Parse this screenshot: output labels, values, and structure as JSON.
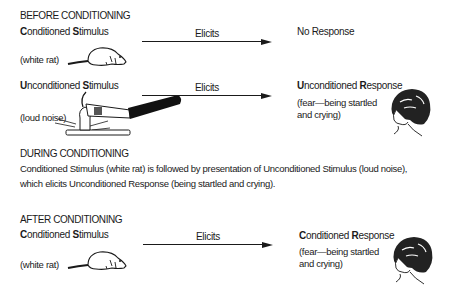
{
  "before": {
    "heading": "BEFORE CONDITIONING",
    "row1": {
      "stimulus_first": "C",
      "stimulus_a": "onditioned ",
      "stimulus_s": "S",
      "stimulus_b": "timulus",
      "stimulus_example": "(white rat)",
      "arrow_label": "Elicits",
      "response": "No Response",
      "icon": "rat-icon"
    },
    "row2": {
      "stimulus_first": "U",
      "stimulus_a": "nconditioned ",
      "stimulus_s": "S",
      "stimulus_b": "timulus",
      "stimulus_example": "(loud noise)",
      "arrow_label": "Elicits",
      "response_first": "U",
      "response_a": "nconditioned ",
      "response_r": "R",
      "response_b": "esponse",
      "response_line1": "(fear—being startled",
      "response_line2": "and crying)",
      "icon": "hammer-icon",
      "response_icon": "child-face-icon"
    }
  },
  "during": {
    "heading": "DURING CONDITIONING",
    "line1": "Conditioned Stimulus (white rat) is followed by presentation of Unconditioned Stimulus (loud noise),",
    "line2": "which elicits  Unconditioned Response (being startled and crying)."
  },
  "after": {
    "heading": "AFTER CONDITIONING",
    "row": {
      "stimulus_first": "C",
      "stimulus_a": "onditioned ",
      "stimulus_s": "S",
      "stimulus_b": "timulus",
      "stimulus_example": "(white rat)",
      "arrow_label": "Elicits",
      "response_first": "C",
      "response_a": "onditioned ",
      "response_r": "R",
      "response_b": "esponse",
      "response_line1": "(fear—being startled",
      "response_line2": "and crying)",
      "icon": "rat-icon",
      "response_icon": "child-face-icon"
    }
  }
}
